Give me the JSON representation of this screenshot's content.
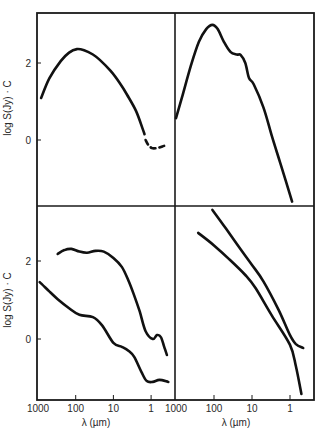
{
  "figure": {
    "panels_layout": "2x2",
    "y_axis_label": "log S(Jy) · C",
    "x_axis_label": "λ (µm)",
    "x_ticks": [
      "1000",
      "100",
      "10",
      "1"
    ],
    "y_ticks": [
      "2",
      "0"
    ],
    "line_color": "#111111",
    "frame_color": "#1a1a1a"
  },
  "chart_data": [
    {
      "type": "line",
      "panel": "top-left",
      "xlabel": "",
      "ylabel": "log S(Jy) · C",
      "x_scale": "log-reversed",
      "xlim": [
        1000,
        0.3
      ],
      "ylim": [
        -1.6,
        3.3
      ],
      "yticks": [
        0,
        2
      ],
      "grid": false,
      "series": [
        {
          "name": "SED 1",
          "x": [
            830,
            500,
            250,
            150,
            93,
            60,
            35,
            23,
            12,
            7,
            4.3,
            2.5,
            1.7,
            1.5
          ],
          "y": [
            1.09,
            1.6,
            2.05,
            2.27,
            2.36,
            2.33,
            2.22,
            2.08,
            1.8,
            1.5,
            1.17,
            0.75,
            0.31,
            0.15
          ]
        },
        {
          "name": "SED 1 (dashed segment)",
          "style": "dashed",
          "x": [
            1.4,
            1.2,
            0.95,
            0.7,
            0.5,
            0.4
          ],
          "y": [
            0.0,
            -0.12,
            -0.21,
            -0.21,
            -0.17,
            -0.13
          ]
        }
      ]
    },
    {
      "type": "line",
      "panel": "top-right",
      "xlabel": "",
      "ylabel": "",
      "x_scale": "log-reversed",
      "xlim": [
        1000,
        0.3
      ],
      "ylim": [
        -1.6,
        3.3
      ],
      "grid": false,
      "series": [
        {
          "name": "SED 2",
          "x": [
            1000,
            700,
            400,
            250,
            160,
            110,
            80,
            55,
            37,
            25,
            20,
            15,
            12,
            9,
            5,
            3,
            1.8,
            0.88
          ],
          "y": [
            0.57,
            1.1,
            1.95,
            2.55,
            2.88,
            2.99,
            2.88,
            2.55,
            2.29,
            2.22,
            2.21,
            2.0,
            1.61,
            1.45,
            0.85,
            0.1,
            -0.6,
            -1.6
          ]
        }
      ]
    },
    {
      "type": "line",
      "panel": "bottom-left",
      "xlabel": "λ (µm)",
      "ylabel": "log S(Jy) · C",
      "x_scale": "log-reversed",
      "xlim": [
        1000,
        0.3
      ],
      "xticks": [
        1000,
        100,
        10,
        1
      ],
      "ylim": [
        -1.6,
        3.3
      ],
      "yticks": [
        0,
        2
      ],
      "grid": false,
      "series": [
        {
          "name": "SED 3a (upper)",
          "x": [
            300,
            200,
            130,
            80,
            50,
            30,
            18,
            10,
            6,
            4,
            2.9,
            2,
            1.4,
            0.9,
            0.7,
            0.55,
            0.45,
            0.38
          ],
          "y": [
            2.18,
            2.28,
            2.31,
            2.24,
            2.21,
            2.26,
            2.24,
            2.08,
            1.85,
            1.5,
            1.15,
            0.7,
            0.2,
            0.0,
            0.1,
            0.05,
            -0.2,
            -0.41
          ]
        },
        {
          "name": "SED 3b (lower)",
          "x": [
            900,
            500,
            300,
            150,
            80,
            35,
            20,
            10,
            6,
            4,
            2.8,
            1.8,
            1.3,
            0.9,
            0.6,
            0.35
          ],
          "y": [
            1.46,
            1.22,
            1.02,
            0.79,
            0.62,
            0.56,
            0.35,
            -0.1,
            -0.2,
            -0.3,
            -0.46,
            -0.85,
            -1.08,
            -1.1,
            -1.05,
            -1.1
          ]
        }
      ]
    },
    {
      "type": "line",
      "panel": "bottom-right",
      "xlabel": "λ (µm)",
      "ylabel": "",
      "x_scale": "log-reversed",
      "xlim": [
        1000,
        0.3
      ],
      "xticks": [
        1000,
        100,
        10,
        1
      ],
      "ylim": [
        -1.6,
        3.3
      ],
      "grid": false,
      "series": [
        {
          "name": "SED 4a",
          "x": [
            110,
            50,
            20,
            10,
            5,
            2,
            1,
            0.7,
            0.45
          ],
          "y": [
            3.31,
            2.85,
            2.3,
            1.9,
            1.48,
            0.75,
            0.1,
            -0.13,
            -0.23
          ]
        },
        {
          "name": "SED 4b",
          "x": [
            260,
            100,
            40,
            15,
            8,
            3,
            1,
            0.7,
            0.5
          ],
          "y": [
            2.72,
            2.4,
            2.05,
            1.64,
            1.3,
            0.6,
            -0.15,
            -0.7,
            -1.41
          ]
        }
      ]
    }
  ]
}
